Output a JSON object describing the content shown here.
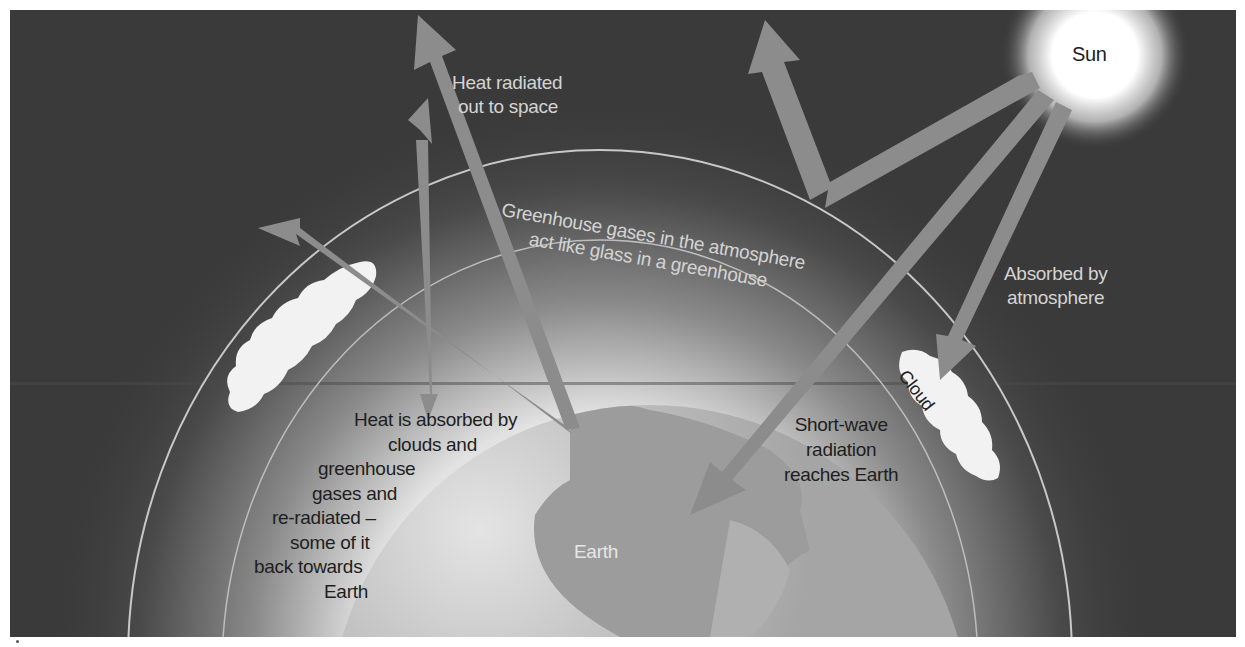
{
  "figure": {
    "colors": {
      "space_background": "#3a3a3a",
      "atmosphere_glow": "#e8e8e8",
      "earth_ocean": "#b5b5b5",
      "earth_land": "#9a9a9a",
      "arrow": "#8c8c8c",
      "cloud": "#f2f2f2",
      "sun": "#ffffff",
      "arc_line": "#c8c8c8"
    },
    "labels": {
      "sun": "Sun",
      "earth": "Earth",
      "cloud": "Cloud",
      "heat_radiated": [
        "Heat radiated",
        "out to space"
      ],
      "greenhouse_gases": [
        "Greenhouse gases in the atmosphere",
        "act like glass in a greenhouse"
      ],
      "absorbed_by_atmosphere": [
        "Absorbed by",
        "atmosphere"
      ],
      "short_wave": [
        "Short-wave",
        "radiation",
        "reaches Earth"
      ],
      "heat_absorbed": [
        "Heat is absorbed by",
        "clouds and",
        "greenhouse",
        "gases and",
        "re-radiated –",
        "some of it",
        "back towards",
        "Earth"
      ]
    },
    "arrows": [
      {
        "name": "sunlight-reflected-to-space",
        "description": "From Sun bounces off atmosphere back up to space"
      },
      {
        "name": "shortwave-to-earth",
        "description": "From Sun to Earth surface"
      },
      {
        "name": "sunlight-to-cloud",
        "description": "From Sun absorbed by cloud/atmosphere"
      },
      {
        "name": "heat-to-space",
        "description": "From Earth radiated out to space"
      },
      {
        "name": "heat-reradiated-left",
        "description": "From Earth toward upper-left, through cloud"
      },
      {
        "name": "heat-reradiated-back",
        "description": "Vertical arrow re-radiated back down towards Earth"
      }
    ]
  }
}
